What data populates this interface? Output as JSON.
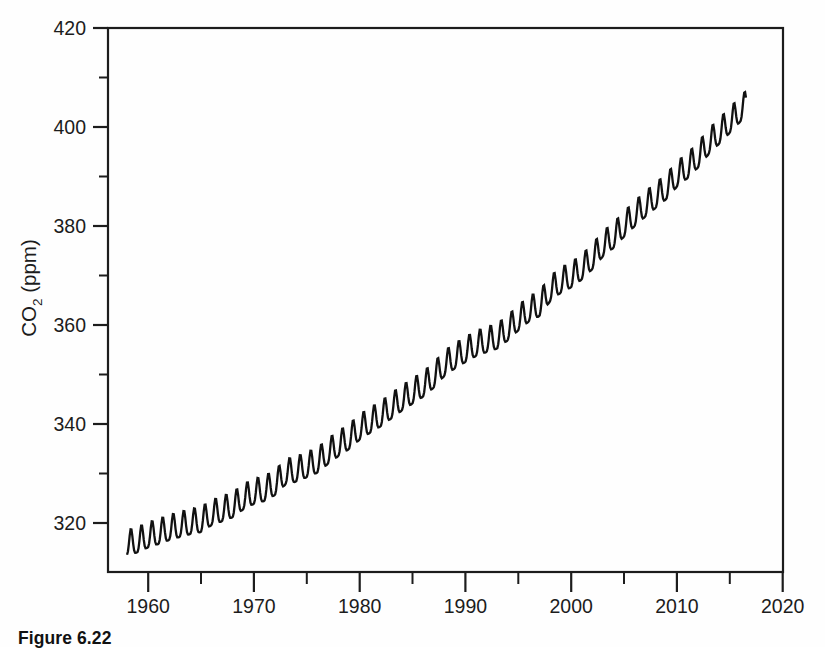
{
  "figure": {
    "caption": "Figure 6.22"
  },
  "chart_data": {
    "type": "line",
    "title": "",
    "subtitle": "",
    "xlabel": "",
    "ylabel": "CO2 (ppm)",
    "ylabel_main": "CO",
    "ylabel_subscript": "2",
    "ylabel_units": "(ppm)",
    "grid": false,
    "legend": null,
    "legend_position": "none",
    "xlim": [
      1956.2,
      2020
    ],
    "ylim": [
      310,
      420
    ],
    "xticks": [
      1960,
      1970,
      1980,
      1990,
      2000,
      2010,
      2020
    ],
    "xtick_labels": [
      "1960",
      "1970",
      "1980",
      "1990",
      "2000",
      "2010",
      "2020"
    ],
    "xticks_minor": [
      1965,
      1975,
      1985,
      1995,
      2005,
      2015
    ],
    "yticks": [
      320,
      340,
      360,
      380,
      400,
      420
    ],
    "ytick_labels": [
      "320",
      "340",
      "360",
      "380",
      "400",
      "420"
    ],
    "yticks_minor": [
      330,
      350,
      370,
      390,
      410
    ],
    "series": [
      {
        "name": "Atmospheric CO2 (Mauna Loa monthly mean)",
        "color": "#111111",
        "annual_trend": {
          "x": [
            1958.0,
            1959,
            1960,
            1961,
            1962,
            1963,
            1964,
            1965,
            1966,
            1967,
            1968,
            1969,
            1970,
            1971,
            1972,
            1973,
            1974,
            1975,
            1976,
            1977,
            1978,
            1979,
            1980,
            1981,
            1982,
            1983,
            1984,
            1985,
            1986,
            1987,
            1988,
            1989,
            1990,
            1991,
            1992,
            1993,
            1994,
            1995,
            1996,
            1997,
            1998,
            1999,
            2000,
            2001,
            2002,
            2003,
            2004,
            2005,
            2006,
            2007,
            2008,
            2009,
            2010,
            2011,
            2012,
            2013,
            2014,
            2015,
            2016.5
          ],
          "y": [
            315.3,
            315.9,
            316.9,
            317.6,
            318.4,
            319.0,
            319.6,
            320.0,
            321.4,
            322.2,
            323.0,
            324.6,
            325.7,
            326.3,
            327.5,
            329.7,
            330.2,
            331.1,
            332.0,
            333.8,
            335.4,
            336.8,
            338.7,
            340.1,
            341.4,
            343.0,
            344.6,
            346.0,
            347.4,
            349.2,
            351.6,
            353.1,
            354.4,
            355.6,
            356.4,
            357.1,
            358.8,
            360.8,
            362.6,
            363.7,
            366.7,
            368.4,
            369.5,
            371.1,
            373.2,
            375.8,
            377.5,
            379.8,
            381.9,
            383.8,
            385.6,
            387.4,
            389.9,
            391.6,
            393.8,
            396.5,
            398.6,
            400.8,
            404.2
          ]
        },
        "seasonal_cycle": {
          "amplitude_ppm": 6.2,
          "peak_month": "May",
          "trough_month": "September",
          "description": "Annual sawtooth oscillation superimposed on rising trend"
        },
        "start_value": 315.3,
        "end_value": 403.5,
        "start_year": 1958.0,
        "end_year": 2016.5
      }
    ],
    "annotations": []
  }
}
